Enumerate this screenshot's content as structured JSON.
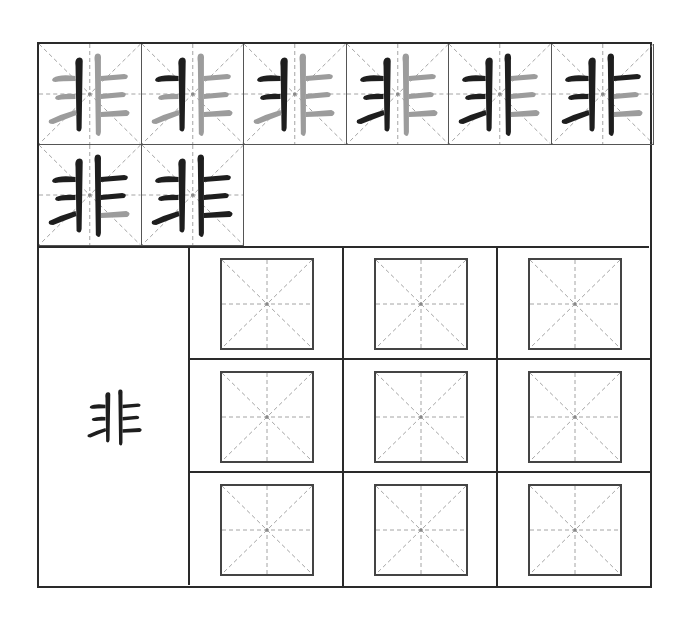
{
  "worksheet": {
    "character": "非",
    "stroke_count": 8,
    "colors": {
      "frame": "#2a2a2a",
      "guide_dash": "#9a9a9a",
      "done_stroke": "#1e1e1e",
      "pending_stroke": "#9c9c9c",
      "center_mark": "#888888"
    },
    "stroke_order_cells": [
      {
        "step": 1,
        "strokes_done": 1
      },
      {
        "step": 2,
        "strokes_done": 2
      },
      {
        "step": 3,
        "strokes_done": 3
      },
      {
        "step": 4,
        "strokes_done": 4
      },
      {
        "step": 5,
        "strokes_done": 5
      },
      {
        "step": 6,
        "strokes_done": 6
      },
      {
        "step": 7,
        "strokes_done": 7
      },
      {
        "step": 8,
        "strokes_done": 8
      }
    ],
    "sample": {
      "character": "非"
    },
    "practice_grid": {
      "rows": 3,
      "cols": 3,
      "style": "mi-zi-ge"
    }
  }
}
